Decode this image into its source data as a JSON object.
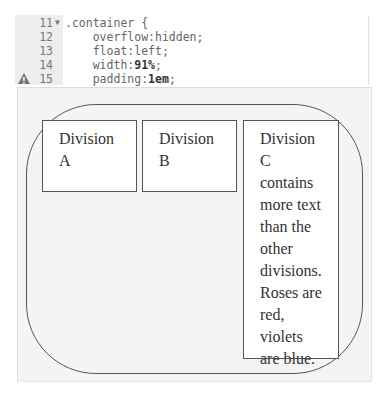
{
  "editor": {
    "lines": [
      {
        "num": "11",
        "fold": true,
        "warn": false,
        "code": ".container {",
        "value": ""
      },
      {
        "num": "12",
        "fold": false,
        "warn": false,
        "code": "    overflow:hidden;",
        "value": ""
      },
      {
        "num": "13",
        "fold": false,
        "warn": false,
        "code": "    float:left;",
        "value": ""
      },
      {
        "num": "14",
        "fold": false,
        "warn": false,
        "code": "    width:",
        "value": "91%",
        "suffix": ";"
      },
      {
        "num": "15",
        "fold": false,
        "warn": true,
        "code": "    padding:",
        "value": "1em",
        "suffix": ";"
      }
    ],
    "fold_icon": "chevron-down-icon",
    "warning_icon": "warning-triangle-icon"
  },
  "preview": {
    "divisions": [
      {
        "text": "Division A"
      },
      {
        "text": "Division B"
      },
      {
        "text": "Division C contains more text than the other divisions. Roses are red, violets are blue."
      }
    ]
  }
}
